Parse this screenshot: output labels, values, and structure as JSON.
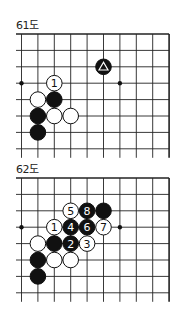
{
  "diagrams": [
    {
      "title": "61도",
      "top": 34,
      "title_top": 16,
      "stones": [
        {
          "color": "black",
          "col": 5,
          "row": 2,
          "mark": "triangle"
        },
        {
          "color": "white",
          "col": 2,
          "row": 3,
          "label": "1"
        },
        {
          "color": "white",
          "col": 1,
          "row": 4
        },
        {
          "color": "black",
          "col": 2,
          "row": 4
        },
        {
          "color": "black",
          "col": 1,
          "row": 5
        },
        {
          "color": "white",
          "col": 2,
          "row": 5
        },
        {
          "color": "white",
          "col": 3,
          "row": 5
        },
        {
          "color": "black",
          "col": 1,
          "row": 6
        }
      ],
      "star_points": [
        {
          "col": 0,
          "row": 3
        },
        {
          "col": 6,
          "row": 3
        }
      ]
    },
    {
      "title": "62도",
      "top": 178,
      "title_top": 160,
      "stones": [
        {
          "color": "white",
          "col": 3,
          "row": 2,
          "label": "5"
        },
        {
          "color": "black",
          "col": 4,
          "row": 2,
          "label": "8"
        },
        {
          "color": "black",
          "col": 5,
          "row": 2
        },
        {
          "color": "white",
          "col": 2,
          "row": 3,
          "label": "1"
        },
        {
          "color": "black",
          "col": 3,
          "row": 3,
          "label": "4"
        },
        {
          "color": "black",
          "col": 4,
          "row": 3,
          "label": "6"
        },
        {
          "color": "white",
          "col": 5,
          "row": 3,
          "label": "7"
        },
        {
          "color": "white",
          "col": 1,
          "row": 4
        },
        {
          "color": "black",
          "col": 2,
          "row": 4
        },
        {
          "color": "black",
          "col": 3,
          "row": 4,
          "label": "2"
        },
        {
          "color": "white",
          "col": 4,
          "row": 4,
          "label": "3"
        },
        {
          "color": "black",
          "col": 1,
          "row": 5
        },
        {
          "color": "white",
          "col": 2,
          "row": 5
        },
        {
          "color": "white",
          "col": 3,
          "row": 5
        },
        {
          "color": "black",
          "col": 1,
          "row": 6
        }
      ],
      "star_points": [
        {
          "col": 0,
          "row": 3
        },
        {
          "col": 6,
          "row": 3
        }
      ]
    }
  ],
  "grid": {
    "x0": 21.5,
    "spacing": 16.4,
    "cols": 10,
    "rows": 8,
    "left_stub": 16,
    "bottom_stub": 9
  }
}
